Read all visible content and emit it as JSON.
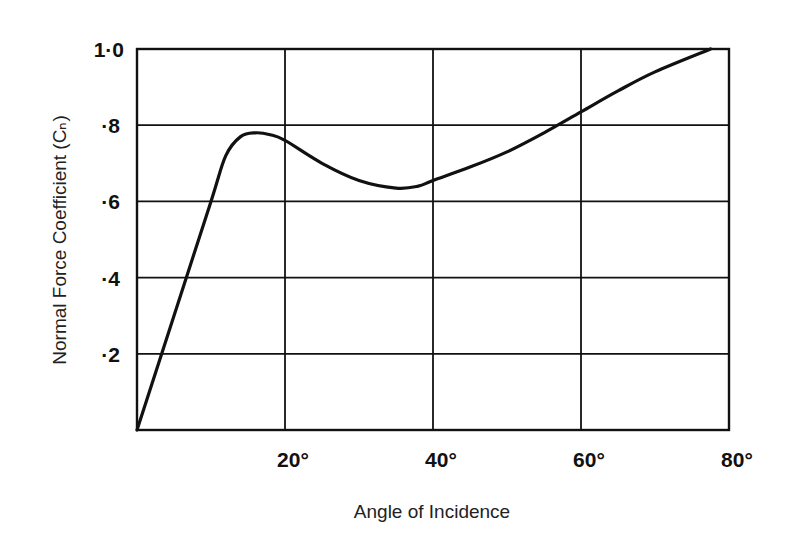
{
  "chart_data": {
    "type": "line",
    "title": "",
    "xlabel": "Angle of Incidence",
    "ylabel": "Normal Force Coefficient (Cₙ)",
    "xlim": [
      0,
      80
    ],
    "ylim": [
      0,
      1.0
    ],
    "grid": true,
    "x_ticks": [
      "20°",
      "40°",
      "60°",
      "80°"
    ],
    "x_tick_values": [
      20,
      40,
      60,
      80
    ],
    "y_ticks": [
      "1·0",
      "·8",
      "·6",
      "·4",
      "·2"
    ],
    "y_tick_values": [
      1.0,
      0.8,
      0.6,
      0.4,
      0.2
    ],
    "series": [
      {
        "name": "Cn",
        "x": [
          0,
          5,
          10,
          12,
          14,
          16,
          18,
          20,
          25,
          30,
          35,
          38,
          40,
          45,
          50,
          55,
          60,
          65,
          70,
          77.5
        ],
        "values": [
          0,
          0.3,
          0.6,
          0.72,
          0.77,
          0.78,
          0.775,
          0.76,
          0.7,
          0.655,
          0.635,
          0.64,
          0.655,
          0.69,
          0.73,
          0.78,
          0.835,
          0.89,
          0.94,
          1.0
        ]
      }
    ],
    "legend": null
  }
}
